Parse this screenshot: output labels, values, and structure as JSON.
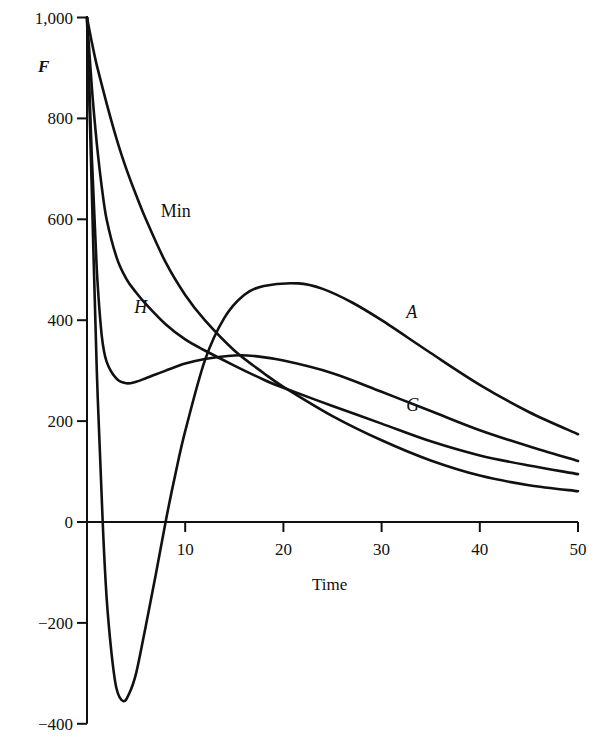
{
  "chart_data": {
    "type": "line",
    "title": "",
    "xlabel": "Time",
    "ylabel": "F",
    "xlim": [
      0,
      50
    ],
    "ylim": [
      -400,
      1000
    ],
    "x_ticks": [
      10,
      20,
      30,
      40,
      50
    ],
    "x_tick_labels": [
      "10",
      "20",
      "30",
      "40",
      "50"
    ],
    "y_ticks": [
      1000,
      800,
      600,
      400,
      200,
      0,
      -200,
      -400
    ],
    "y_tick_labels": [
      "1,000",
      "800",
      "600",
      "400",
      "200",
      "0",
      "−200",
      "−400"
    ],
    "grid": false,
    "legend": "inline labels on curves",
    "series": [
      {
        "name": "Min",
        "label_style": "roman",
        "points": [
          [
            0,
            1000
          ],
          [
            0.5,
            950
          ],
          [
            1,
            905
          ],
          [
            2,
            830
          ],
          [
            3,
            760
          ],
          [
            4,
            700
          ],
          [
            5,
            648
          ],
          [
            6,
            600
          ],
          [
            8,
            515
          ],
          [
            10,
            450
          ],
          [
            12,
            400
          ],
          [
            15,
            340
          ],
          [
            18,
            295
          ],
          [
            20,
            268
          ],
          [
            25,
            210
          ],
          [
            30,
            162
          ],
          [
            35,
            122
          ],
          [
            40,
            92
          ],
          [
            45,
            73
          ],
          [
            50,
            61
          ]
        ]
      },
      {
        "name": "H",
        "label_style": "italic",
        "points": [
          [
            0,
            1000
          ],
          [
            0.5,
            860
          ],
          [
            1,
            750
          ],
          [
            1.5,
            665
          ],
          [
            2,
            600
          ],
          [
            3,
            525
          ],
          [
            4,
            482
          ],
          [
            5,
            455
          ],
          [
            6,
            432
          ],
          [
            8,
            392
          ],
          [
            10,
            362
          ],
          [
            12,
            340
          ],
          [
            15,
            310
          ],
          [
            18,
            282
          ],
          [
            20,
            266
          ],
          [
            25,
            230
          ],
          [
            30,
            195
          ],
          [
            35,
            160
          ],
          [
            40,
            132
          ],
          [
            45,
            112
          ],
          [
            50,
            95
          ]
        ]
      },
      {
        "name": "G",
        "label_style": "italic",
        "points": [
          [
            0,
            1000
          ],
          [
            0.5,
            720
          ],
          [
            1,
            500
          ],
          [
            1.5,
            370
          ],
          [
            2,
            318
          ],
          [
            3,
            284
          ],
          [
            4,
            275
          ],
          [
            5,
            278
          ],
          [
            6,
            285
          ],
          [
            8,
            300
          ],
          [
            10,
            314
          ],
          [
            12,
            323
          ],
          [
            15,
            330
          ],
          [
            17,
            329
          ],
          [
            20,
            320
          ],
          [
            25,
            295
          ],
          [
            30,
            258
          ],
          [
            35,
            220
          ],
          [
            40,
            182
          ],
          [
            45,
            150
          ],
          [
            50,
            121
          ]
        ]
      },
      {
        "name": "A",
        "label_style": "italic",
        "points": [
          [
            0,
            1000
          ],
          [
            0.5,
            650
          ],
          [
            1,
            300
          ],
          [
            1.6,
            0
          ],
          [
            2,
            -150
          ],
          [
            2.5,
            -260
          ],
          [
            3,
            -330
          ],
          [
            3.7,
            -355
          ],
          [
            4.3,
            -340
          ],
          [
            5,
            -300
          ],
          [
            6,
            -205
          ],
          [
            7,
            -105
          ],
          [
            8,
            0
          ],
          [
            9,
            95
          ],
          [
            10,
            180
          ],
          [
            12,
            320
          ],
          [
            14,
            405
          ],
          [
            16,
            450
          ],
          [
            18,
            468
          ],
          [
            21.5,
            473
          ],
          [
            24,
            462
          ],
          [
            27,
            435
          ],
          [
            30,
            400
          ],
          [
            35,
            335
          ],
          [
            40,
            272
          ],
          [
            45,
            218
          ],
          [
            50,
            174
          ]
        ]
      }
    ],
    "annotations": [
      {
        "text": "Min",
        "x": 7.5,
        "y": 605
      },
      {
        "text": "H",
        "x": 4.8,
        "y": 415
      },
      {
        "text": "A",
        "x": 32.5,
        "y": 405
      },
      {
        "text": "G",
        "x": 32.5,
        "y": 220
      }
    ]
  }
}
